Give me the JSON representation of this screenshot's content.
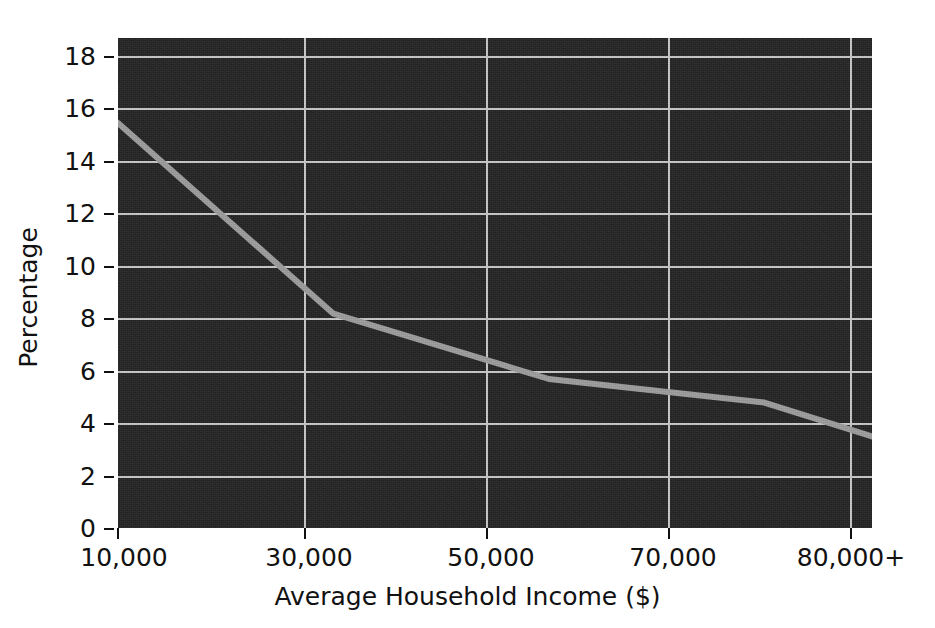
{
  "chart_data": {
    "type": "line",
    "title": "",
    "xlabel": "Average Household Income ($)",
    "ylabel": "Percentage",
    "categories": [
      "10,000",
      "30,000",
      "50,000",
      "70,000",
      "80,000+"
    ],
    "x": [
      10000,
      30000,
      50000,
      70000,
      80000
    ],
    "values": [
      15.5,
      8.2,
      5.7,
      4.8,
      3.5
    ],
    "series": [
      {
        "name": "Percentage",
        "values": [
          15.5,
          8.2,
          5.7,
          4.8,
          3.5
        ]
      }
    ],
    "xtick_labels": [
      "10,000",
      "30,000",
      "50,000",
      "70,000",
      "80,000+"
    ],
    "ytick_labels": [
      "0",
      "2",
      "4",
      "6",
      "8",
      "10",
      "12",
      "14",
      "16",
      "18"
    ],
    "ytick_values": [
      0,
      2,
      4,
      6,
      8,
      10,
      12,
      14,
      16,
      18
    ],
    "ylim": [
      0,
      18.75
    ],
    "grid": true,
    "legend": "none",
    "colors": {
      "plot_background": "#222222",
      "grid": "#c9c9c9",
      "line": "#9d9d9d",
      "text": "#111111",
      "page_background": "#ffffff"
    },
    "line_width_px": 6
  },
  "axes": {
    "y_title": "Percentage",
    "x_title": "Average Household Income ($)",
    "y_ticks": [
      {
        "label": "18",
        "value": 18
      },
      {
        "label": "16",
        "value": 16
      },
      {
        "label": "14",
        "value": 14
      },
      {
        "label": "12",
        "value": 12
      },
      {
        "label": "10",
        "value": 10
      },
      {
        "label": "8",
        "value": 8
      },
      {
        "label": "6",
        "value": 6
      },
      {
        "label": "4",
        "value": 4
      },
      {
        "label": "2",
        "value": 2
      },
      {
        "label": "0",
        "value": 0
      }
    ],
    "x_ticks": [
      {
        "label": "10,000",
        "value": 10000
      },
      {
        "label": "30,000",
        "value": 30000
      },
      {
        "label": "50,000",
        "value": 50000
      },
      {
        "label": "70,000",
        "value": 70000
      },
      {
        "label": "80,000+",
        "value": 80000
      }
    ]
  }
}
